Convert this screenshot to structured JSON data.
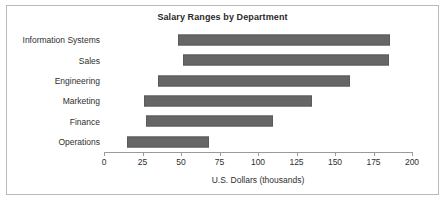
{
  "chart_data": {
    "type": "bar",
    "orientation": "horizontal",
    "subtype": "range-bar",
    "title": "Salary Ranges by Department",
    "xlabel": "U.S. Dollars (thousands)",
    "ylabel": "",
    "xlim": [
      0,
      200
    ],
    "xticks": [
      0,
      25,
      50,
      75,
      100,
      125,
      150,
      175,
      200
    ],
    "xtick_labels": [
      "0",
      "25",
      "50",
      "75",
      "100",
      "125",
      "150",
      "175",
      "200"
    ],
    "grid": false,
    "legend": null,
    "categories": [
      "Information Systems",
      "Sales",
      "Engineering",
      "Marketing",
      "Finance",
      "Operations"
    ],
    "bars": [
      {
        "category": "Information Systems",
        "start": 48,
        "end": 186,
        "span": 138
      },
      {
        "category": "Sales",
        "start": 51,
        "end": 185,
        "span": 134
      },
      {
        "category": "Engineering",
        "start": 35,
        "end": 160,
        "span": 125
      },
      {
        "category": "Marketing",
        "start": 26,
        "end": 135,
        "span": 109
      },
      {
        "category": "Finance",
        "start": 27,
        "end": 110,
        "span": 83
      },
      {
        "category": "Operations",
        "start": 15,
        "end": 68,
        "span": 53
      }
    ],
    "series": [
      {
        "name": "Minimum Salary",
        "values": [
          48,
          51,
          35,
          26,
          27,
          15
        ]
      },
      {
        "name": "Maximum Salary",
        "values": [
          186,
          185,
          160,
          135,
          110,
          68
        ]
      }
    ],
    "colors": {
      "bar_fill": "#666666",
      "bar_border": "#5a5a5a",
      "axis": "#9a9a9a",
      "text": "#2f2f2f",
      "title_text": "#2a2a2a",
      "frame_border": "#b9b9b9",
      "background": "#ffffff"
    }
  }
}
